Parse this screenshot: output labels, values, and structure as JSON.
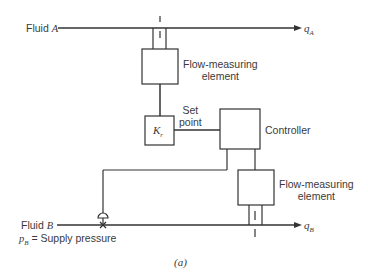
{
  "diagram": {
    "type": "ratio flow control block diagram",
    "fluid_a": {
      "label": "Fluid ",
      "var": "A"
    },
    "fluid_b": {
      "label": "Fluid ",
      "var": "B"
    },
    "q_a": {
      "sym": "q",
      "sub": "A"
    },
    "q_b": {
      "sym": "q",
      "sub": "B"
    },
    "flow_element_top": {
      "line1": "Flow-measuring",
      "line2": "element"
    },
    "flow_element_bottom": {
      "line1": "Flow-measuring",
      "line2": "element"
    },
    "ratio_block": {
      "sym": "K",
      "sub": "r"
    },
    "set_point": {
      "line1": "Set",
      "line2": "point"
    },
    "controller": {
      "label": "Controller"
    },
    "supply": {
      "sym": "p",
      "sub": "B",
      "text": " = Supply pressure"
    },
    "caption": "(a)"
  }
}
